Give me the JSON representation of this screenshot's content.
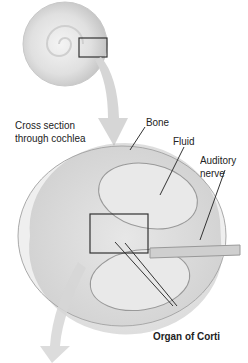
{
  "diagram": {
    "labels": {
      "cross_section_line1": "Cross section",
      "cross_section_line2": "through cochlea",
      "bone": "Bone",
      "fluid": "Fluid",
      "auditory_line1": "Auditory",
      "auditory_line2": "nerve",
      "organ": "Organ of Corti"
    },
    "colors": {
      "arrow": "#d6d6d6",
      "shell": "#e2e2e2",
      "line": "#333333"
    }
  }
}
